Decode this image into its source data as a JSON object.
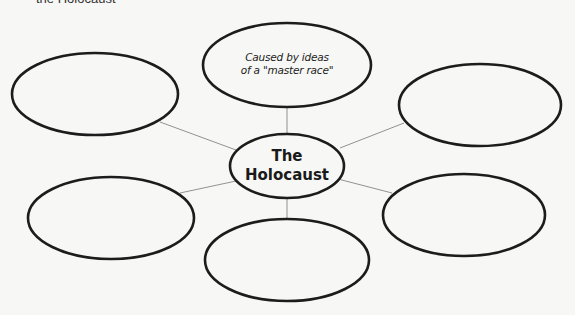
{
  "header": {
    "partial_text": "the Holocaust"
  },
  "diagram": {
    "center": {
      "line1": "The",
      "line2": "Holocaust"
    },
    "nodes": [
      {
        "position": "top",
        "line1": "Caused by ideas",
        "line2": "of a \"master race\""
      },
      {
        "position": "top-left",
        "text": ""
      },
      {
        "position": "top-right",
        "text": ""
      },
      {
        "position": "bottom-left",
        "text": ""
      },
      {
        "position": "bottom-right",
        "text": ""
      },
      {
        "position": "bottom",
        "text": ""
      }
    ]
  }
}
